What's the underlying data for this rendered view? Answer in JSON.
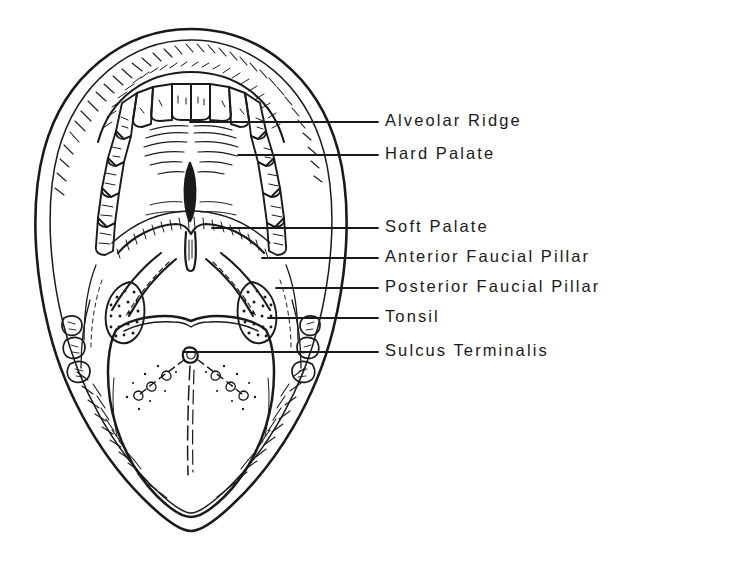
{
  "figure": {
    "ink_color": "#1a1a1a",
    "background_color": "#ffffff"
  },
  "labels": [
    {
      "id": "alveolar-ridge",
      "text": "Alveolar Ridge",
      "x": 385,
      "y": 111,
      "leader_y": 122,
      "leader_x_start": 190,
      "leader_x_end": 378
    },
    {
      "id": "hard-palate",
      "text": "Hard Palate",
      "x": 385,
      "y": 144,
      "leader_y": 155,
      "leader_x_start": 238,
      "leader_x_end": 378
    },
    {
      "id": "soft-palate",
      "text": "Soft Palate",
      "x": 385,
      "y": 217,
      "leader_y": 228,
      "leader_x_start": 212,
      "leader_x_end": 378
    },
    {
      "id": "anterior-faucial-pillar",
      "text": "Anterior Faucial Pillar",
      "x": 385,
      "y": 247,
      "leader_y": 258,
      "leader_x_start": 262,
      "leader_x_end": 378
    },
    {
      "id": "posterior-faucial-pillar",
      "text": "Posterior Faucial Pillar",
      "x": 385,
      "y": 277,
      "leader_y": 288,
      "leader_x_start": 276,
      "leader_x_end": 378
    },
    {
      "id": "tonsil",
      "text": "Tonsil",
      "x": 385,
      "y": 307,
      "leader_y": 318,
      "leader_x_start": 268,
      "leader_x_end": 378
    },
    {
      "id": "sulcus-terminalis",
      "text": "Sulcus Terminalis",
      "x": 385,
      "y": 341,
      "leader_y": 352,
      "leader_x_start": 183,
      "leader_x_end": 378
    }
  ],
  "structures": {
    "outer_lip": "oval lip border",
    "upper_teeth": "maxillary dental arch",
    "hard_palate": "palatal vault with rugae and median raphe",
    "soft_palate": "velum with uvula",
    "faucial_pillars": "anterior and posterior pillars",
    "tonsils": "stippled palatine tonsils",
    "tongue": "dorsum with foramen cecum, sulcus terminalis and median sulcus"
  }
}
